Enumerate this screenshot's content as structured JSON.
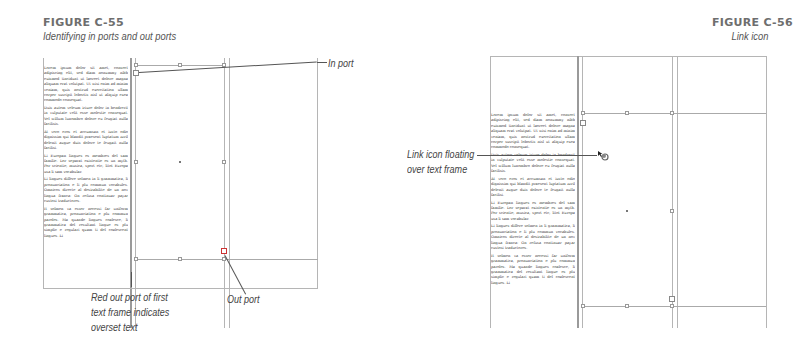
{
  "figures": [
    {
      "label": "FIGURE C-55",
      "caption": "Identifying in ports and out ports",
      "callouts": {
        "in_port": "In port",
        "out_port": "Out port",
        "red_out_port_line1": "Red out port of first",
        "red_out_port_line2": "text frame indicates",
        "red_out_port_line3": "overset text"
      }
    },
    {
      "label": "FIGURE C-56",
      "caption": "Link icon",
      "callouts": {
        "link_icon_line1": "Link icon floating",
        "link_icon_line2": "over text frame"
      }
    }
  ],
  "body_text": {
    "p1": "Lorem ipsum dolor sit amet, consect adipiscing elit, sed diam nonummy nibh euismod tincidunt ut laoreet dolore magna aliquam erat volutpat. Ut wisi enim ad minim veniam, quis nostrud exercitation ullam corper suscipit lobortis nisl ut aliquip exea commodo consequat.",
    "p2": "Duis autem veleum iriure dolor in hendrerit in vulputate velit esse molestie consequat. Vel willum lunombro dolore eu feugiat nulla facilisis.",
    "p3": "At vero eros et accumsan et iusto odio dignissim qui blandit praesent luptatum zzril delenit augue duis dolore te feugait nulla facilisi.",
    "p4": "Li Europan lingues es membres del sam familie. Lor separat existentie es un myth. Por scientie, musica, sport etc, litot Europa usa li sam vocabular.",
    "p5": "Li lingues differe solmen in li grammatica, li pronunciation e li plu commun vocabules. Omnicos directe al desirabilite de un nov lingua franca: On refusa continuar payar custosi traductores.",
    "p6": "It solmen va esser necessi far uniform grammatica, pronunciation e plu commun paroles. Ma quande lingues coalesce, li grammatica del resultant lingue es plu simplic e regulari quam ti del coalescent lingues. Li"
  },
  "icons": {
    "link_icon": "link-icon"
  },
  "colors": {
    "guide": "#b5b5b5",
    "frame": "#9a9a9a",
    "leader": "#555555",
    "label": "#6e6e6e"
  }
}
